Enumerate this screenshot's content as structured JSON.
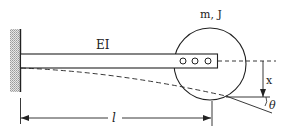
{
  "diagram": {
    "type": "cantilever-beam-with-end-mass",
    "labels": {
      "beam_stiffness": "EI",
      "end_mass": "m, J",
      "deflection": "x",
      "rotation": "θ",
      "length": "l"
    },
    "components": {
      "support": "fixed wall (hatched)",
      "beam": "uniform elastic beam",
      "end_body": "rigid disk bolted to beam end with 3 bolts",
      "deflected_shape": "dashed curve",
      "dimension": "length from wall to disk center"
    },
    "colors": {
      "line": "#222222",
      "hatch": "#9a9a9a",
      "background": "#ffffff"
    }
  }
}
